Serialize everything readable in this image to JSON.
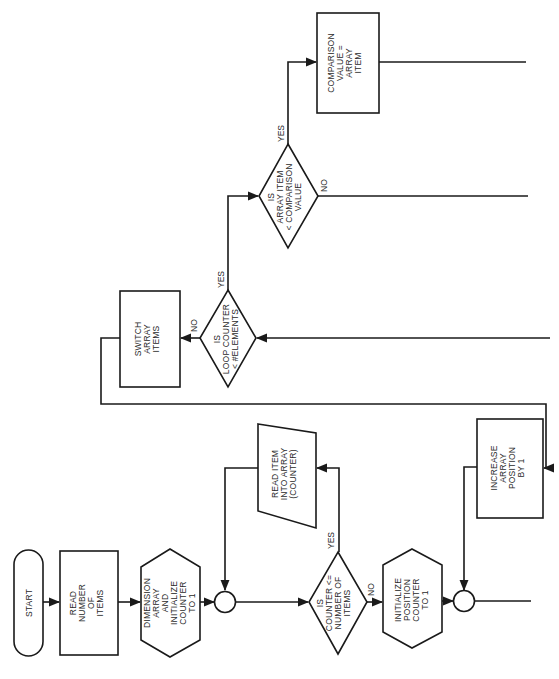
{
  "diagram": {
    "type": "flowchart",
    "orientation": "rotated 90° counter-clockwise; text reads bottom-to-top",
    "nodes": {
      "start": {
        "shape": "terminal",
        "lines": [
          "START"
        ]
      },
      "read_count": {
        "shape": "process",
        "lines": [
          "READ",
          "NUMBER",
          "OF",
          "ITEMS"
        ]
      },
      "dim_array": {
        "shape": "preparation",
        "lines": [
          "DIMENSION",
          "ARRAY",
          "AND",
          "INITIALIZE",
          "COUNTER",
          "TO 1"
        ]
      },
      "connector_1": {
        "shape": "connector",
        "lines": []
      },
      "decision_counter": {
        "shape": "decision",
        "lines": [
          "IS",
          "COUNTER <=",
          "NUMBER OF",
          "ITEMS"
        ]
      },
      "read_item": {
        "shape": "input-output",
        "lines": [
          "READ ITEM",
          "INTO ARRAY",
          "(COUNTER)"
        ]
      },
      "init_position": {
        "shape": "preparation",
        "lines": [
          "INITIALIZE",
          "POSITION",
          "COUNTER",
          "TO 1"
        ]
      },
      "connector_2": {
        "shape": "connector",
        "lines": []
      },
      "increase_position": {
        "shape": "process",
        "lines": [
          "INCREASE",
          "ARRAY",
          "POSITION",
          "BY 1"
        ]
      },
      "decision_loop": {
        "shape": "decision",
        "lines": [
          "IS",
          "LOOP COUNTER",
          "< #ELEMENTS"
        ]
      },
      "switch_items": {
        "shape": "process",
        "lines": [
          "SWITCH",
          "ARRAY",
          "ITEMS"
        ]
      },
      "decision_compare": {
        "shape": "decision",
        "lines": [
          "IS",
          "ARRAY ITEM",
          "< COMPARISON",
          "VALUE"
        ]
      },
      "set_compare": {
        "shape": "process",
        "lines": [
          "COMPARISON",
          "VALUE =",
          "ARRAY",
          "ITEM"
        ]
      }
    },
    "edge_labels": {
      "counter_yes": "YES",
      "counter_no": "NO",
      "loop_yes": "YES",
      "loop_no": "NO",
      "compare_yes": "YES",
      "compare_no": "NO"
    },
    "edges": [
      {
        "from": "start",
        "to": "read_count"
      },
      {
        "from": "read_count",
        "to": "dim_array"
      },
      {
        "from": "dim_array",
        "to": "connector_1"
      },
      {
        "from": "connector_1",
        "to": "decision_counter"
      },
      {
        "from": "decision_counter",
        "to": "read_item",
        "label": "YES"
      },
      {
        "from": "read_item",
        "to": "connector_1"
      },
      {
        "from": "decision_counter",
        "to": "init_position",
        "label": "NO"
      },
      {
        "from": "init_position",
        "to": "connector_2"
      },
      {
        "from": "increase_position",
        "to": "connector_2"
      },
      {
        "from": "switch_items",
        "to": "increase_position"
      },
      {
        "from": "decision_loop",
        "to": "switch_items",
        "label": "NO"
      },
      {
        "from": "decision_loop",
        "to": "decision_compare",
        "label": "YES"
      },
      {
        "from": "decision_compare",
        "to": "set_compare",
        "label": "YES"
      },
      {
        "from": "decision_compare",
        "to": "(off-page)",
        "label": "NO"
      }
    ],
    "colors": {
      "stroke": "#1a1a1a",
      "text": "#2a2a2a",
      "background": "#ffffff"
    }
  }
}
